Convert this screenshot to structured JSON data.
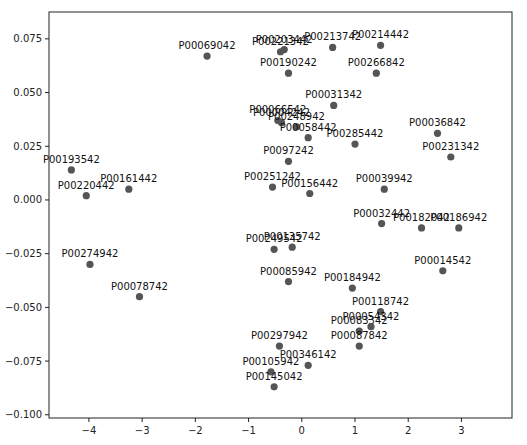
{
  "chart_data": {
    "type": "scatter",
    "title": "",
    "xlabel": "",
    "ylabel": "",
    "xlim": [
      -4.75,
      3.95
    ],
    "ylim": [
      -0.1015,
      0.0875
    ],
    "xticks": [
      -4,
      -3,
      -2,
      -1,
      0,
      1,
      2,
      3
    ],
    "xtick_labels": [
      "−4",
      "−3",
      "−2",
      "−1",
      "0",
      "1",
      "2",
      "3"
    ],
    "yticks": [
      0.075,
      0.05,
      0.025,
      0.0,
      -0.025,
      -0.05,
      -0.075,
      -0.1
    ],
    "ytick_labels": [
      "0.075",
      "0.050",
      "0.025",
      "0.000",
      "−0.025",
      "−0.050",
      "−0.075",
      "−0.100"
    ],
    "grid": false,
    "legend": null,
    "marker_color": "#555555",
    "points": [
      {
        "label": "P00069042",
        "x": -1.78,
        "y": 0.067
      },
      {
        "label": "P00203442",
        "x": -0.33,
        "y": 0.07
      },
      {
        "label": "P00221342",
        "x": -0.4,
        "y": 0.069
      },
      {
        "label": "P00213742",
        "x": 0.58,
        "y": 0.071
      },
      {
        "label": "P00214442",
        "x": 1.48,
        "y": 0.072
      },
      {
        "label": "P00190242",
        "x": -0.25,
        "y": 0.059
      },
      {
        "label": "P00266842",
        "x": 1.4,
        "y": 0.059
      },
      {
        "label": "P00031342",
        "x": 0.6,
        "y": 0.044
      },
      {
        "label": "P00066542",
        "x": -0.45,
        "y": 0.037
      },
      {
        "label": "P00004242",
        "x": -0.38,
        "y": 0.036
      },
      {
        "label": "P00248942",
        "x": -0.1,
        "y": 0.034
      },
      {
        "label": "P00058442",
        "x": 0.12,
        "y": 0.029
      },
      {
        "label": "P00285442",
        "x": 1.0,
        "y": 0.026
      },
      {
        "label": "P00036842",
        "x": 2.55,
        "y": 0.031
      },
      {
        "label": "P00231342",
        "x": 2.8,
        "y": 0.02
      },
      {
        "label": "P0097242",
        "x": -0.25,
        "y": 0.018
      },
      {
        "label": "P00193542",
        "x": -4.33,
        "y": 0.014
      },
      {
        "label": "P00161442",
        "x": -3.25,
        "y": 0.005
      },
      {
        "label": "P00220442",
        "x": -4.05,
        "y": 0.002
      },
      {
        "label": "P00251242",
        "x": -0.55,
        "y": 0.006
      },
      {
        "label": "P00156442",
        "x": 0.15,
        "y": 0.003
      },
      {
        "label": "P00039942",
        "x": 1.55,
        "y": 0.005
      },
      {
        "label": "P00032442",
        "x": 1.5,
        "y": -0.011
      },
      {
        "label": "P00182042",
        "x": 2.25,
        "y": -0.013
      },
      {
        "label": "P00186942",
        "x": 2.95,
        "y": -0.013
      },
      {
        "label": "P00249542",
        "x": -0.52,
        "y": -0.023
      },
      {
        "label": "P00135742",
        "x": -0.18,
        "y": -0.022
      },
      {
        "label": "P00014542",
        "x": 2.65,
        "y": -0.033
      },
      {
        "label": "P00274942",
        "x": -3.98,
        "y": -0.03
      },
      {
        "label": "P00078742",
        "x": -3.05,
        "y": -0.045
      },
      {
        "label": "P00085942",
        "x": -0.25,
        "y": -0.038
      },
      {
        "label": "P00184942",
        "x": 0.95,
        "y": -0.041
      },
      {
        "label": "P00118742",
        "x": 1.48,
        "y": -0.052
      },
      {
        "label": "P00083342",
        "x": 1.08,
        "y": -0.061
      },
      {
        "label": "P00054342",
        "x": 1.3,
        "y": -0.059
      },
      {
        "label": "P00087842",
        "x": 1.08,
        "y": -0.068
      },
      {
        "label": "P00297942",
        "x": -0.42,
        "y": -0.068
      },
      {
        "label": "P00346142",
        "x": 0.12,
        "y": -0.077
      },
      {
        "label": "P00105942",
        "x": -0.58,
        "y": -0.08
      },
      {
        "label": "P00145042",
        "x": -0.52,
        "y": -0.087
      }
    ]
  }
}
